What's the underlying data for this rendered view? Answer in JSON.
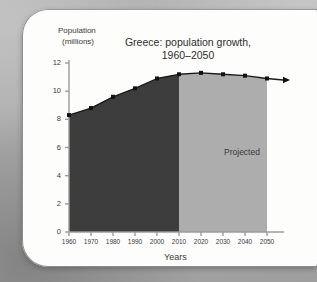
{
  "chart_data": {
    "type": "area",
    "title": "Greece: population growth, 1960–2050",
    "title_line1": "Greece: population growth,",
    "title_line2": "1960–2050",
    "xlabel": "Years",
    "ylabel_line1": "Population",
    "ylabel_line2": "(millions)",
    "annotation": "Projected",
    "x": [
      1960,
      1970,
      1980,
      1990,
      2000,
      2010,
      2020,
      2030,
      2040,
      2050
    ],
    "values": [
      8.3,
      8.8,
      9.6,
      10.2,
      10.9,
      11.2,
      11.3,
      11.2,
      11.1,
      10.9
    ],
    "xtick_labels": [
      "1960",
      "1970",
      "1980",
      "1990",
      "2000",
      "2010",
      "2020",
      "2030",
      "2040",
      "2050"
    ],
    "ytick_labels": [
      "0",
      "2",
      "4",
      "6",
      "8",
      "10",
      "12"
    ],
    "ytick_values": [
      0,
      2,
      4,
      6,
      8,
      10,
      12
    ],
    "xlim": [
      1960,
      2050
    ],
    "ylim": [
      0,
      12
    ],
    "grid": false,
    "legend": "none",
    "historical_range": [
      1960,
      2010
    ],
    "projected_range": [
      2010,
      2050
    ],
    "colors": {
      "historical_fill": "#3d3d3d",
      "projected_fill": "#adadad",
      "line": "#1a1a1a",
      "marker": "#111111",
      "axis": "#9b9b9b",
      "text": "#3a3a3a",
      "card": "#fdfdfb",
      "backdrop": "#b0b0b0"
    }
  }
}
